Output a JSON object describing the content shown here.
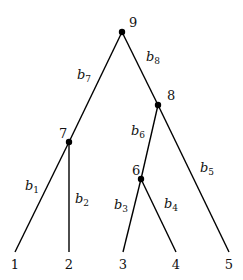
{
  "diagram": {
    "type": "rooted-binary-tree",
    "nodes": [
      {
        "id": "1",
        "label": "1",
        "x": 15,
        "y": 252,
        "leaf": true,
        "lx": 15,
        "ly": 269
      },
      {
        "id": "2",
        "label": "2",
        "x": 69,
        "y": 252,
        "leaf": true,
        "lx": 69,
        "ly": 269
      },
      {
        "id": "3",
        "label": "3",
        "x": 123,
        "y": 252,
        "leaf": true,
        "lx": 123,
        "ly": 269
      },
      {
        "id": "4",
        "label": "4",
        "x": 176,
        "y": 252,
        "leaf": true,
        "lx": 176,
        "ly": 269
      },
      {
        "id": "5",
        "label": "5",
        "x": 229,
        "y": 252,
        "leaf": true,
        "lx": 229,
        "ly": 269
      },
      {
        "id": "6",
        "label": "6",
        "x": 141,
        "y": 179,
        "leaf": false,
        "lx": 132,
        "ly": 175
      },
      {
        "id": "7",
        "label": "7",
        "x": 69,
        "y": 142,
        "leaf": false,
        "lx": 59,
        "ly": 138
      },
      {
        "id": "8",
        "label": "8",
        "x": 158,
        "y": 105,
        "leaf": false,
        "lx": 167,
        "ly": 100
      },
      {
        "id": "9",
        "label": "9",
        "x": 122,
        "y": 32,
        "leaf": false,
        "lx": 129,
        "ly": 27
      }
    ],
    "edges": [
      {
        "from": "7",
        "to": "1",
        "label": "b",
        "sub": "1",
        "lx": 25,
        "ly": 190
      },
      {
        "from": "7",
        "to": "2",
        "label": "b",
        "sub": "2",
        "lx": 75,
        "ly": 203
      },
      {
        "from": "6",
        "to": "3",
        "label": "b",
        "sub": "3",
        "lx": 114,
        "ly": 209
      },
      {
        "from": "6",
        "to": "4",
        "label": "b",
        "sub": "4",
        "lx": 164,
        "ly": 208
      },
      {
        "from": "8",
        "to": "5",
        "label": "b",
        "sub": "5",
        "lx": 200,
        "ly": 172
      },
      {
        "from": "8",
        "to": "6",
        "label": "b",
        "sub": "6",
        "lx": 131,
        "ly": 135
      },
      {
        "from": "9",
        "to": "7",
        "label": "b",
        "sub": "7",
        "lx": 77,
        "ly": 79
      },
      {
        "from": "9",
        "to": "8",
        "label": "b",
        "sub": "8",
        "lx": 146,
        "ly": 61
      }
    ]
  }
}
